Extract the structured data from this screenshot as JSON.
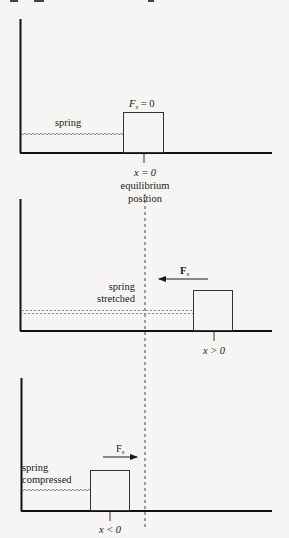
{
  "colors": {
    "background": "#f6f5f3",
    "ink": "#1a1a1a",
    "outline": "#333333"
  },
  "panels": [
    {
      "id": "equilibrium",
      "spring_label": "spring",
      "force_label_main": "F",
      "force_label_sub": "s",
      "force_label_eq": " = 0",
      "position_label": "x = 0",
      "position_caption_line1": "equilibrium",
      "position_caption_line2": "position",
      "arrow": "none"
    },
    {
      "id": "stretched",
      "spring_label_line1": "spring",
      "spring_label_line2": "stretched",
      "force_label_main": "F",
      "force_label_sub": "s",
      "force_arrow_direction": "left",
      "position_label": "x > 0"
    },
    {
      "id": "compressed",
      "spring_label_line1": "spring",
      "spring_label_line2": "compressed",
      "force_label_main": "F",
      "force_label_sub": "s",
      "force_arrow_direction": "right",
      "position_label": "x < 0"
    }
  ]
}
